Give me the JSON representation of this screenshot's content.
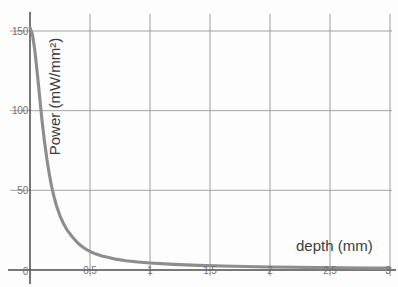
{
  "chart_data": {
    "type": "line",
    "title": "",
    "subtitle": "",
    "xlabel": "depth (mm)",
    "ylabel": "Power (mW/mm²)",
    "xlim": [
      0,
      3
    ],
    "ylim": [
      0,
      155
    ],
    "grid": true,
    "legend": null,
    "legend_position": "none",
    "x_ticks": [
      0,
      0.5,
      1,
      1.5,
      2,
      2.5,
      3
    ],
    "x_tick_labels": [
      "0",
      "0.5",
      "1",
      "1.5",
      "2",
      "2.5",
      "3"
    ],
    "y_ticks": [
      0,
      50,
      100,
      150
    ],
    "y_tick_labels": [
      "0",
      "50",
      "100",
      "150"
    ],
    "series": [
      {
        "name": "Power vs depth",
        "color": "#8c8c8c",
        "x": [
          0.0,
          0.02,
          0.04,
          0.06,
          0.08,
          0.1,
          0.12,
          0.14,
          0.16,
          0.18,
          0.2,
          0.22,
          0.25,
          0.28,
          0.31,
          0.35,
          0.4,
          0.45,
          0.5,
          0.55,
          0.6,
          0.7,
          0.8,
          0.9,
          1.0,
          1.2,
          1.4,
          1.6,
          1.8,
          2.0,
          2.2,
          2.4,
          2.6,
          2.8,
          3.0
        ],
        "y": [
          152.0,
          148.0,
          138.0,
          124.0,
          109.0,
          94.0,
          81.0,
          70.0,
          60.5,
          52.5,
          46.0,
          40.5,
          34.0,
          29.0,
          25.0,
          21.0,
          16.8,
          13.8,
          11.6,
          10.0,
          8.8,
          7.0,
          5.8,
          5.0,
          4.4,
          3.5,
          2.9,
          2.5,
          2.2,
          1.9,
          1.7,
          1.5,
          1.4,
          1.3,
          1.2
        ]
      }
    ],
    "annotations": [],
    "axis_color": "#555555",
    "grid_color": "#9a9a9a",
    "label_color": "#6e6e6e",
    "title_color": "#3a3a3a",
    "background_color": "#fdfdfd"
  }
}
